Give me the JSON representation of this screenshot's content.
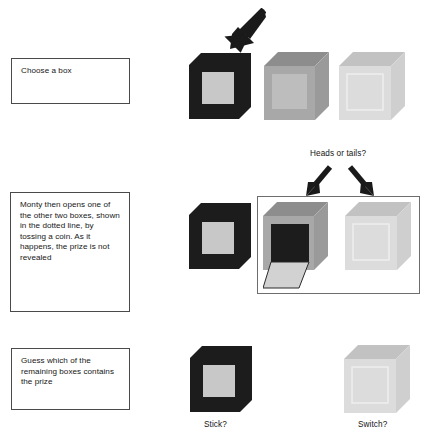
{
  "diagram": {
    "background": "#ffffff"
  },
  "palette": {
    "ink": "#161616",
    "box_border": "#4a4a4a",
    "dotted_border": "#6d6d6d",
    "cube_dark_front": "#1c1c1c",
    "cube_dark_panel": "#c8c8c8",
    "cube_mid_front": "#a8a8a8",
    "cube_mid_top": "#8d8d8d",
    "cube_mid_side": "#9a9a9a",
    "cube_light_front": "#dcdcdc",
    "cube_light_top": "#c2c2c2",
    "cube_light_side": "#cfcfcf",
    "cube_open_interior": "#1c1c1c",
    "cube_lid_flap": "#d2d2d2",
    "arrow_fill": "#1a1a1a"
  },
  "rows": [
    {
      "id": "row-choose",
      "caption": "Choose a box",
      "cubes": [
        {
          "name": "chosen-box",
          "style": "dark-closed"
        },
        {
          "name": "box-two",
          "style": "mid-closed"
        },
        {
          "name": "box-three",
          "style": "light-closed"
        }
      ],
      "arrow": {
        "name": "pointer-arrow-to-chosen-box",
        "direction": "down-left"
      }
    },
    {
      "id": "row-monty-opens",
      "caption": "Monty then opens one of the other two boxes, shown in the dotted line, by tossing a coin. As it happens, the prize is not revealed",
      "coin_label": "Heads or tails?",
      "cubes": [
        {
          "name": "chosen-box",
          "style": "dark-closed"
        },
        {
          "name": "opened-box",
          "style": "mid-open"
        },
        {
          "name": "box-three",
          "style": "light-closed"
        }
      ],
      "arrows": [
        {
          "name": "coin-arrow-left",
          "direction": "down-left"
        },
        {
          "name": "coin-arrow-right",
          "direction": "down-right"
        }
      ],
      "group_outline": "dotted-rectangle"
    },
    {
      "id": "row-guess",
      "caption": "Guess which of the remaining boxes contains the prize",
      "cubes": [
        {
          "name": "stick-box",
          "style": "dark-closed",
          "label": "Stick?"
        },
        {
          "name": "switch-box",
          "style": "light-closed",
          "label": "Switch?"
        }
      ]
    }
  ],
  "labels": {
    "heads_or_tails": "Heads or tails?",
    "stick": "Stick?",
    "switch": "Switch?"
  },
  "captions": {
    "choose": "Choose a box",
    "monty_opens": "Monty then opens one of the other two boxes, shown in the dotted line, by tossing a coin. As it happens, the prize is not revealed",
    "guess": "Guess which of the remaining boxes contains the prize"
  }
}
